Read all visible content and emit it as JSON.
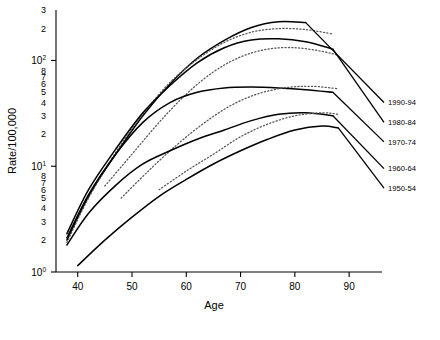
{
  "chart_data": {
    "type": "line",
    "title": "",
    "xlabel": "Age",
    "ylabel": "Rate/100,000",
    "yscale": "log",
    "xlim": [
      36,
      92
    ],
    "ylim": [
      1,
      300
    ],
    "grid": false,
    "legend_position": "right",
    "xticks": [
      40,
      50,
      60,
      70,
      80,
      90
    ],
    "xticklabels": [
      "40",
      "50",
      "60",
      "70",
      "80",
      "90"
    ],
    "ymajorticks": [
      1,
      10,
      100
    ],
    "ymajorlabels": [
      "10",
      "10",
      "10"
    ],
    "ymajorexponents": [
      "0",
      "1",
      "2"
    ],
    "yminorticks": [
      2,
      3,
      4,
      5,
      6,
      7,
      8,
      20,
      30,
      40,
      50,
      60,
      70,
      80,
      200,
      300
    ],
    "yminorlabels": [
      "2",
      "3",
      "4",
      "5",
      "6",
      "7",
      "8",
      "2",
      "3",
      "4",
      "5",
      "6",
      "7",
      "8",
      "2",
      "3"
    ],
    "series": [
      {
        "name": "1990-94",
        "style": "solid",
        "label_y": 40,
        "x": [
          38,
          42,
          47,
          52,
          57,
          62,
          67,
          72,
          77,
          82
        ],
        "values": [
          2.0,
          5.2,
          13.0,
          30.0,
          60.0,
          105.0,
          155.0,
          205.0,
          232.0,
          228.0
        ]
      },
      {
        "name": "1990-94-fitted",
        "style": "dotted",
        "x": [
          38,
          42,
          47,
          52,
          57,
          62,
          67,
          72,
          77,
          82,
          87
        ],
        "values": [
          1.9,
          5.0,
          13.5,
          31.0,
          62.0,
          102.0,
          148.0,
          185.0,
          200.0,
          196.0,
          178.0
        ]
      },
      {
        "name": "1980-84",
        "style": "solid",
        "label_y": 26,
        "x": [
          38,
          42,
          47,
          52,
          57,
          62,
          67,
          72,
          77,
          82,
          87
        ],
        "values": [
          2.3,
          6.0,
          14.5,
          32.0,
          58.0,
          95.0,
          132.0,
          156.0,
          160.0,
          150.0,
          128.0
        ]
      },
      {
        "name": "1980-84-fitted",
        "style": "dotted",
        "x": [
          45,
          50,
          55,
          60,
          65,
          70,
          75,
          80,
          85,
          88
        ],
        "values": [
          6.5,
          13.0,
          26.0,
          48.0,
          78.0,
          108.0,
          128.0,
          132.0,
          122.0,
          112.0
        ]
      },
      {
        "name": "1970-74",
        "style": "solid",
        "label_y": 17,
        "x": [
          38,
          42,
          47,
          52,
          57,
          62,
          67,
          72,
          77,
          82,
          87
        ],
        "values": [
          2.1,
          5.4,
          13.0,
          26.0,
          40.0,
          50.0,
          55.0,
          56.0,
          55.0,
          53.0,
          50.0
        ]
      },
      {
        "name": "1970-74-fitted",
        "style": "dotted",
        "x": [
          48,
          53,
          58,
          63,
          68,
          73,
          78,
          83,
          88
        ],
        "values": [
          5.0,
          9.0,
          15.5,
          25.0,
          37.0,
          48.0,
          55.0,
          57.0,
          54.0
        ]
      },
      {
        "name": "1960-64",
        "style": "solid",
        "label_y": 9.5,
        "x": [
          38,
          42,
          47,
          52,
          57,
          62,
          67,
          72,
          77,
          82,
          87
        ],
        "values": [
          1.8,
          3.6,
          6.6,
          10.5,
          14.0,
          18.0,
          22.0,
          27.0,
          31.0,
          32.0,
          30.0
        ]
      },
      {
        "name": "1960-64-fitted",
        "style": "dotted",
        "x": [
          55,
          60,
          65,
          70,
          75,
          80,
          85,
          88
        ],
        "values": [
          6.0,
          9.0,
          13.0,
          19.0,
          25.0,
          30.0,
          32.0,
          31.0
        ]
      },
      {
        "name": "1950-54",
        "style": "solid",
        "label_y": 6.2,
        "x": [
          40,
          45,
          50,
          55,
          60,
          65,
          70,
          75,
          80,
          85,
          88
        ],
        "values": [
          1.15,
          2.0,
          3.3,
          5.2,
          7.5,
          10.5,
          14.0,
          18.0,
          22.0,
          24.0,
          23.0
        ]
      }
    ],
    "legend_entries": [
      {
        "label": "1990-94"
      },
      {
        "label": "1980-84"
      },
      {
        "label": "1970-74"
      },
      {
        "label": "1960-64"
      },
      {
        "label": "1950-54"
      }
    ]
  }
}
